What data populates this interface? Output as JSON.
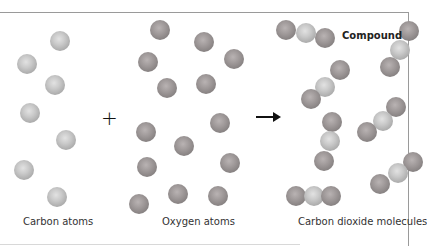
{
  "labels": {
    "carbon": "Carbon atoms",
    "oxygen": "Oxygen atoms",
    "co2": "Carbon dioxide molecules",
    "compound": "Compound"
  },
  "symbols": {
    "plus": "+",
    "arrow": "right-arrow"
  },
  "colors": {
    "carbon": "#c8c8c8",
    "oxygen": "#8e8888",
    "frame": "#9a9a9a"
  },
  "carbon_atoms": [
    {
      "x": 60,
      "y": 41
    },
    {
      "x": 27,
      "y": 64
    },
    {
      "x": 55,
      "y": 85
    },
    {
      "x": 30,
      "y": 113
    },
    {
      "x": 66,
      "y": 140
    },
    {
      "x": 24,
      "y": 170
    },
    {
      "x": 57,
      "y": 197
    }
  ],
  "oxygen_atoms": [
    {
      "x": 160,
      "y": 30
    },
    {
      "x": 204,
      "y": 42
    },
    {
      "x": 148,
      "y": 62
    },
    {
      "x": 234,
      "y": 59
    },
    {
      "x": 167,
      "y": 88
    },
    {
      "x": 206,
      "y": 84
    },
    {
      "x": 220,
      "y": 123
    },
    {
      "x": 146,
      "y": 132
    },
    {
      "x": 184,
      "y": 146
    },
    {
      "x": 147,
      "y": 167
    },
    {
      "x": 230,
      "y": 163
    },
    {
      "x": 139,
      "y": 204
    },
    {
      "x": 178,
      "y": 194
    },
    {
      "x": 218,
      "y": 196
    }
  ],
  "co2_molecules": [
    [
      {
        "x": 286,
        "y": 30,
        "t": "oxygen"
      },
      {
        "x": 306,
        "y": 33,
        "t": "carbon"
      },
      {
        "x": 325,
        "y": 38,
        "t": "oxygen"
      }
    ],
    [
      {
        "x": 409,
        "y": 31,
        "t": "oxygen"
      },
      {
        "x": 400,
        "y": 50,
        "t": "carbon"
      },
      {
        "x": 390,
        "y": 67,
        "t": "oxygen"
      }
    ],
    [
      {
        "x": 340,
        "y": 70,
        "t": "oxygen"
      },
      {
        "x": 325,
        "y": 87,
        "t": "carbon"
      },
      {
        "x": 311,
        "y": 99,
        "t": "oxygen"
      }
    ],
    [
      {
        "x": 332,
        "y": 122,
        "t": "oxygen"
      },
      {
        "x": 330,
        "y": 141,
        "t": "carbon"
      },
      {
        "x": 324,
        "y": 161,
        "t": "oxygen"
      }
    ],
    [
      {
        "x": 396,
        "y": 107,
        "t": "oxygen"
      },
      {
        "x": 383,
        "y": 121,
        "t": "carbon"
      },
      {
        "x": 367,
        "y": 132,
        "t": "oxygen"
      }
    ],
    [
      {
        "x": 413,
        "y": 162,
        "t": "oxygen"
      },
      {
        "x": 398,
        "y": 173,
        "t": "carbon"
      },
      {
        "x": 380,
        "y": 184,
        "t": "oxygen"
      }
    ],
    [
      {
        "x": 296,
        "y": 196,
        "t": "oxygen"
      },
      {
        "x": 314,
        "y": 196,
        "t": "carbon"
      },
      {
        "x": 331,
        "y": 196,
        "t": "oxygen"
      }
    ]
  ]
}
